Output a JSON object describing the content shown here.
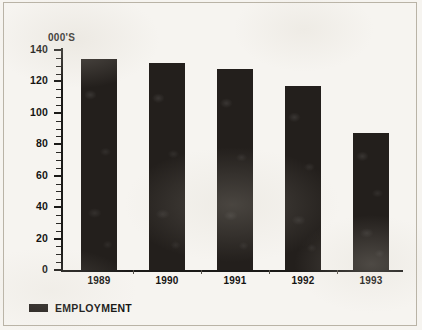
{
  "chart_data": {
    "type": "bar",
    "title": "",
    "subtitle": "",
    "xlabel": "",
    "ylabel": "000'S",
    "categories": [
      "1989",
      "1990",
      "1991",
      "1992",
      "1993"
    ],
    "values": [
      134,
      132,
      128,
      117,
      87
    ],
    "series": [
      {
        "name": "EMPLOYMENT",
        "values": [
          134,
          132,
          128,
          117,
          87
        ]
      }
    ],
    "ylim": [
      0,
      140
    ],
    "y_ticks": [
      0,
      20,
      40,
      60,
      80,
      100,
      120,
      140
    ],
    "y_minor_tick_step": 5,
    "grid": false,
    "legend_position": "bottom-left",
    "bar_color": "#231f1c",
    "axis_color": "#1b1a18",
    "background_color": "#f6f4f0"
  },
  "legend": {
    "entries": [
      {
        "label": "EMPLOYMENT",
        "color": "#231f1c"
      }
    ]
  }
}
